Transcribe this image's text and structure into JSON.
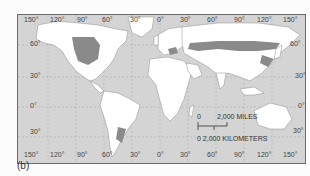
{
  "figure": {
    "panel_label": "(b)",
    "type": "world map",
    "colors": {
      "ocean": "#d4d4d4",
      "land": "#ffffff",
      "highlight_region": "#8a8a8a",
      "border": "#6a6a6a"
    }
  },
  "map": {
    "top_longitude_labels": [
      "150°",
      "120°",
      "90°",
      "60°",
      "30°",
      "0°",
      "30°",
      "60°",
      "90°",
      "120°",
      "150°"
    ],
    "bottom_longitude_labels": [
      "150°",
      "120°",
      "90°",
      "60°",
      "30°",
      "0°",
      "30°",
      "60°",
      "90°",
      "120°",
      "150°"
    ],
    "left_latitude_labels": [
      "60°",
      "30°",
      "0°",
      "30°"
    ],
    "right_latitude_labels": [
      "60°",
      "30°",
      "0°",
      "30°"
    ]
  },
  "scale_bar": {
    "miles_zero": "0",
    "miles_label": "2,000 MILES",
    "km_label": "0  2,000 KILOMETERS"
  }
}
